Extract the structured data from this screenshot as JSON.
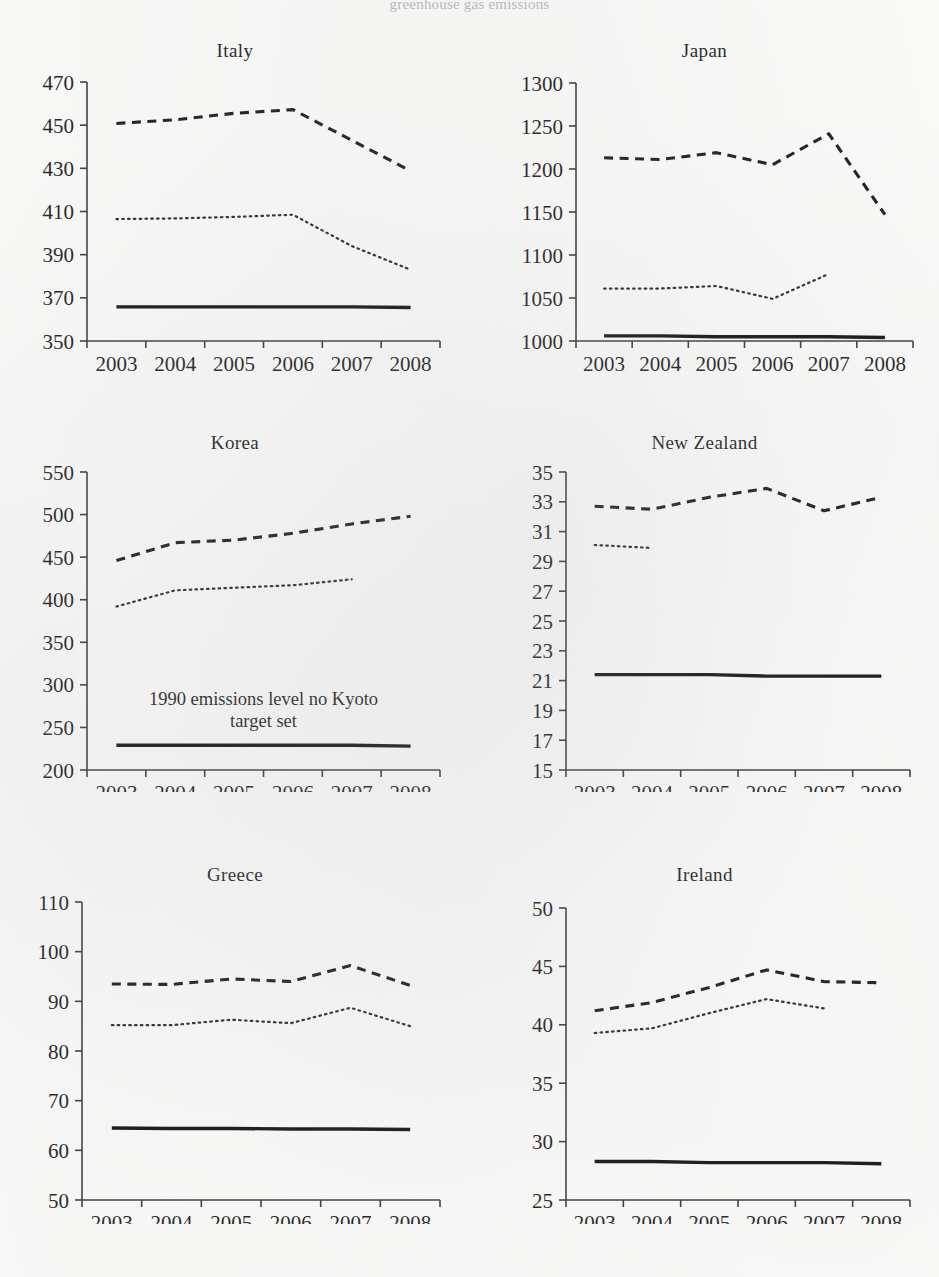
{
  "figure": {
    "cropped_header_text": "greenhouse gas emissions",
    "series_styles": {
      "dashed": "dashed-line",
      "dotted": "dotted-line",
      "solid": "solid-baseline"
    },
    "x_categories": [
      "2003",
      "2004",
      "2005",
      "2006",
      "2007",
      "2008"
    ]
  },
  "chart_data": [
    {
      "type": "line",
      "title": "Italy",
      "xlabel": "",
      "ylabel": "",
      "x": [
        "2003",
        "2004",
        "2005",
        "2006",
        "2007",
        "2008"
      ],
      "ylim": [
        350,
        470
      ],
      "yticks": [
        350,
        370,
        390,
        410,
        430,
        450,
        470
      ],
      "grid": false,
      "legend": "none",
      "series": [
        {
          "name": "dashed-line",
          "style": "dashed",
          "values": [
            450.8,
            452.5,
            455.5,
            457.2,
            443.0,
            428.8
          ]
        },
        {
          "name": "dotted-line",
          "style": "dotted",
          "values": [
            406.5,
            406.8,
            407.5,
            408.5,
            394.0,
            383.0
          ]
        },
        {
          "name": "solid-baseline",
          "style": "solid",
          "values": [
            365.8,
            365.8,
            365.8,
            365.8,
            365.8,
            365.5
          ]
        }
      ]
    },
    {
      "type": "line",
      "title": "Japan",
      "xlabel": "",
      "ylabel": "",
      "x": [
        "2003",
        "2004",
        "2005",
        "2006",
        "2007",
        "2008"
      ],
      "ylim": [
        1000,
        1300
      ],
      "yticks": [
        1000,
        1050,
        1100,
        1150,
        1200,
        1250,
        1300
      ],
      "grid": false,
      "legend": "none",
      "series": [
        {
          "name": "dashed-line",
          "style": "dashed",
          "values": [
            1213,
            1211,
            1219,
            1205,
            1241,
            1147
          ]
        },
        {
          "name": "dotted-line",
          "style": "dotted",
          "values": [
            1061,
            1061,
            1064,
            1049,
            1078,
            null
          ]
        },
        {
          "name": "solid-baseline",
          "style": "solid",
          "values": [
            1006,
            1006,
            1005,
            1005,
            1005,
            1004
          ]
        }
      ]
    },
    {
      "type": "line",
      "title": "Korea",
      "xlabel": "",
      "ylabel": "",
      "x": [
        "2003",
        "2004",
        "2005",
        "2006",
        "2007",
        "2008"
      ],
      "ylim": [
        200,
        550
      ],
      "yticks": [
        200,
        250,
        300,
        350,
        400,
        450,
        500,
        550
      ],
      "grid": false,
      "legend": "none",
      "annotation": "1990 emissions level no Kyoto target set",
      "series": [
        {
          "name": "dashed-line",
          "style": "dashed",
          "values": [
            446,
            467,
            470,
            478,
            489,
            498
          ]
        },
        {
          "name": "dotted-line",
          "style": "dotted",
          "values": [
            392,
            411,
            414,
            417,
            424,
            null
          ]
        },
        {
          "name": "solid-baseline",
          "style": "solid",
          "values": [
            229,
            229,
            229,
            229,
            229,
            228
          ]
        }
      ]
    },
    {
      "type": "line",
      "title": "New Zealand",
      "xlabel": "",
      "ylabel": "",
      "x": [
        "2003",
        "2004",
        "2005",
        "2006",
        "2007",
        "2008"
      ],
      "ylim": [
        15,
        35
      ],
      "yticks": [
        15,
        17,
        19,
        21,
        23,
        25,
        27,
        29,
        31,
        33,
        35
      ],
      "grid": false,
      "legend": "none",
      "series": [
        {
          "name": "dashed-line",
          "style": "dashed",
          "values": [
            32.7,
            32.5,
            33.3,
            33.9,
            32.4,
            33.3
          ]
        },
        {
          "name": "dotted-line",
          "style": "dotted",
          "values": [
            30.1,
            29.9,
            null,
            null,
            null,
            null
          ]
        },
        {
          "name": "solid-baseline",
          "style": "solid",
          "values": [
            21.4,
            21.4,
            21.4,
            21.3,
            21.3,
            21.3
          ]
        }
      ]
    },
    {
      "type": "line",
      "title": "Greece",
      "xlabel": "",
      "ylabel": "",
      "x": [
        "2003",
        "2004",
        "2005",
        "2006",
        "2007",
        "2008"
      ],
      "ylim": [
        50,
        110
      ],
      "yticks": [
        50,
        60,
        70,
        80,
        90,
        100,
        110
      ],
      "grid": false,
      "legend": "none",
      "series": [
        {
          "name": "dashed-line",
          "style": "dashed",
          "values": [
            93.5,
            93.4,
            94.5,
            94.0,
            97.2,
            93.2
          ]
        },
        {
          "name": "dotted-line",
          "style": "dotted",
          "values": [
            85.2,
            85.2,
            86.3,
            85.6,
            88.7,
            85.0
          ]
        },
        {
          "name": "solid-baseline",
          "style": "solid",
          "values": [
            64.5,
            64.4,
            64.4,
            64.3,
            64.3,
            64.2
          ]
        }
      ]
    },
    {
      "type": "line",
      "title": "Ireland",
      "xlabel": "",
      "ylabel": "",
      "x": [
        "2003",
        "2004",
        "2005",
        "2006",
        "2007",
        "2008"
      ],
      "ylim": [
        25,
        50
      ],
      "yticks": [
        25,
        30,
        35,
        40,
        45,
        50
      ],
      "grid": false,
      "legend": "none",
      "series": [
        {
          "name": "dashed-line",
          "style": "dashed",
          "values": [
            41.2,
            41.9,
            43.2,
            44.7,
            43.7,
            43.6
          ]
        },
        {
          "name": "dotted-line",
          "style": "dotted",
          "values": [
            39.3,
            39.7,
            41.0,
            42.2,
            41.4,
            null
          ]
        },
        {
          "name": "solid-baseline",
          "style": "solid",
          "values": [
            28.3,
            28.3,
            28.2,
            28.2,
            28.2,
            28.1
          ]
        }
      ]
    }
  ]
}
